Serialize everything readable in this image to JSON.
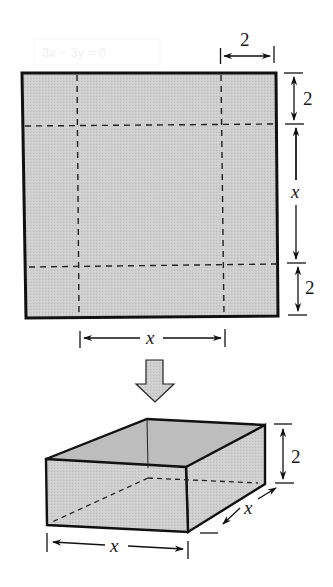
{
  "figure": {
    "colors": {
      "fill": "#c9c9c9",
      "stroke": "#111111",
      "background": "#ffffff"
    },
    "sheet": {
      "top_dimension_label": "2",
      "right_top_label": "2",
      "right_middle_label": "x",
      "right_bottom_label": "2",
      "bottom_dimension_label": "x"
    },
    "arrow": {
      "icon": "down-arrow-icon"
    },
    "box": {
      "height_label": "2",
      "depth_label": "x",
      "width_label": "x"
    },
    "ghost_text": "3x − 3y = 0"
  }
}
